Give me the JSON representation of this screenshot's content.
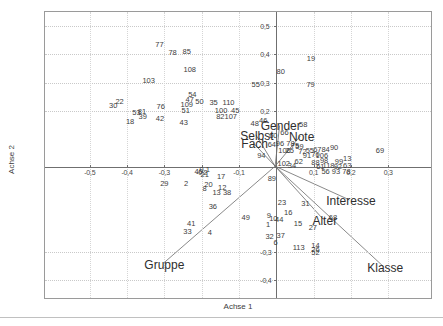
{
  "chart_data": {
    "type": "scatter",
    "title": "",
    "xlabel": "Achse 1",
    "ylabel": "Achse 2",
    "xlim": [
      -0.62,
      0.42
    ],
    "ylim": [
      -0.47,
      0.55
    ],
    "grid": true,
    "legend": "none",
    "xticks": [
      {
        "value": -0.5,
        "label": "-0,5"
      },
      {
        "value": -0.4,
        "label": "-0,4"
      },
      {
        "value": -0.3,
        "label": "-0,3"
      },
      {
        "value": -0.2,
        "label": "-0,2"
      },
      {
        "value": -0.1,
        "label": "-0,1"
      },
      {
        "value": 0.1,
        "label": "0,1"
      },
      {
        "value": 0.2,
        "label": "0,2"
      },
      {
        "value": 0.3,
        "label": "0,3"
      }
    ],
    "yticks": [
      {
        "value": 0.5,
        "label": "0,5"
      },
      {
        "value": 0.4,
        "label": "0,4"
      },
      {
        "value": 0.3,
        "label": "0,3"
      },
      {
        "value": 0.2,
        "label": "0,2"
      },
      {
        "value": -0.3,
        "label": "-0,3"
      },
      {
        "value": -0.4,
        "label": "-0,4"
      }
    ],
    "variables": [
      {
        "name": "Gender",
        "label": "Gender",
        "lx": 0.012,
        "ly": 0.145,
        "tipx": 0.004,
        "tipy": 0.03
      },
      {
        "name": "Selbst",
        "label": "Selbst",
        "lx": -0.052,
        "ly": 0.112,
        "tipx": -0.012,
        "tipy": 0.028
      },
      {
        "name": "Fach",
        "label": "Fach",
        "lx": -0.058,
        "ly": 0.082,
        "tipx": -0.016,
        "tipy": 0.022
      },
      {
        "name": "Note",
        "label": "Note",
        "lx": 0.068,
        "ly": 0.108,
        "tipx": 0.02,
        "tipy": 0.03
      },
      {
        "name": "Interesse",
        "label": "Interesse",
        "lx": 0.2,
        "ly": -0.12,
        "tipx": 0.165,
        "tipy": -0.088
      },
      {
        "name": "Alter",
        "label": "Alter",
        "lx": 0.13,
        "ly": -0.19,
        "tipx": 0.1,
        "tipy": -0.15
      },
      {
        "name": "Gruppe",
        "label": "Gruppe",
        "lx": -0.3,
        "ly": -0.345,
        "tipx": -0.262,
        "tipy": -0.31
      },
      {
        "name": "Klasse",
        "label": "Klasse",
        "lx": 0.292,
        "ly": -0.358,
        "tipx": 0.262,
        "tipy": -0.33
      }
    ],
    "points": [
      {
        "label": "77",
        "x": -0.313,
        "y": 0.432
      },
      {
        "label": "78",
        "x": -0.278,
        "y": 0.405
      },
      {
        "label": "85",
        "x": -0.24,
        "y": 0.41
      },
      {
        "label": "108",
        "x": -0.232,
        "y": 0.345
      },
      {
        "label": "103",
        "x": -0.342,
        "y": 0.305
      },
      {
        "label": "55",
        "x": -0.055,
        "y": 0.292
      },
      {
        "label": "80",
        "x": 0.012,
        "y": 0.337
      },
      {
        "label": "19",
        "x": 0.093,
        "y": 0.382
      },
      {
        "label": "79",
        "x": 0.092,
        "y": 0.292
      },
      {
        "label": "54",
        "x": -0.225,
        "y": 0.255
      },
      {
        "label": "47",
        "x": -0.232,
        "y": 0.238
      },
      {
        "label": "50",
        "x": -0.206,
        "y": 0.232
      },
      {
        "label": "109",
        "x": -0.24,
        "y": 0.222
      },
      {
        "label": "35",
        "x": -0.168,
        "y": 0.228
      },
      {
        "label": "110",
        "x": -0.128,
        "y": 0.228
      },
      {
        "label": "22",
        "x": -0.42,
        "y": 0.232
      },
      {
        "label": "30",
        "x": -0.437,
        "y": 0.218
      },
      {
        "label": "76",
        "x": -0.31,
        "y": 0.215
      },
      {
        "label": "51",
        "x": -0.243,
        "y": 0.198
      },
      {
        "label": "100",
        "x": -0.148,
        "y": 0.2
      },
      {
        "label": "45",
        "x": -0.11,
        "y": 0.2
      },
      {
        "label": "53",
        "x": -0.375,
        "y": 0.192
      },
      {
        "label": "81",
        "x": -0.36,
        "y": 0.196
      },
      {
        "label": "82",
        "x": -0.15,
        "y": 0.178
      },
      {
        "label": "107",
        "x": -0.122,
        "y": 0.178
      },
      {
        "label": "39",
        "x": -0.358,
        "y": 0.178
      },
      {
        "label": "42",
        "x": -0.312,
        "y": 0.172
      },
      {
        "label": "18",
        "x": -0.392,
        "y": 0.16
      },
      {
        "label": "43",
        "x": -0.248,
        "y": 0.158
      },
      {
        "label": "48",
        "x": -0.058,
        "y": 0.152
      },
      {
        "label": "46",
        "x": -0.035,
        "y": 0.165
      },
      {
        "label": "58",
        "x": 0.072,
        "y": 0.15
      },
      {
        "label": "60",
        "x": -0.008,
        "y": 0.112
      },
      {
        "label": "66",
        "x": 0.022,
        "y": 0.122
      },
      {
        "label": "64",
        "x": -0.012,
        "y": 0.08
      },
      {
        "label": "96",
        "x": 0.01,
        "y": 0.082
      },
      {
        "label": "78b",
        "x": 0.038,
        "y": 0.082
      },
      {
        "label": "75",
        "x": 0.05,
        "y": 0.075
      },
      {
        "label": "59",
        "x": 0.062,
        "y": 0.072
      },
      {
        "label": "90",
        "x": 0.155,
        "y": 0.068
      },
      {
        "label": "69",
        "x": 0.278,
        "y": 0.058
      },
      {
        "label": "106b",
        "x": 0.022,
        "y": 0.058
      },
      {
        "label": "25",
        "x": 0.036,
        "y": 0.056
      },
      {
        "label": "72",
        "x": 0.07,
        "y": 0.055
      },
      {
        "label": "55b",
        "x": 0.09,
        "y": 0.058
      },
      {
        "label": "67",
        "x": 0.11,
        "y": 0.06
      },
      {
        "label": "84",
        "x": 0.132,
        "y": 0.06
      },
      {
        "label": "94",
        "x": -0.04,
        "y": 0.04
      },
      {
        "label": "91",
        "x": 0.082,
        "y": 0.04
      },
      {
        "label": "70",
        "x": 0.105,
        "y": 0.042
      },
      {
        "label": "106",
        "x": 0.122,
        "y": 0.04
      },
      {
        "label": "62",
        "x": 0.06,
        "y": 0.018
      },
      {
        "label": "88",
        "x": 0.105,
        "y": 0.015
      },
      {
        "label": "98",
        "x": 0.128,
        "y": 0.022
      },
      {
        "label": "99",
        "x": 0.168,
        "y": 0.02
      },
      {
        "label": "13b",
        "x": 0.19,
        "y": 0.03
      },
      {
        "label": "102",
        "x": 0.02,
        "y": 0.012
      },
      {
        "label": "34",
        "x": 0.042,
        "y": 0.005
      },
      {
        "label": "61",
        "x": 0.118,
        "y": 0.002
      },
      {
        "label": "118",
        "x": 0.14,
        "y": 0.005
      },
      {
        "label": "92",
        "x": 0.165,
        "y": 0.0
      },
      {
        "label": "63",
        "x": 0.19,
        "y": 0.005
      },
      {
        "label": "56",
        "x": 0.132,
        "y": -0.018
      },
      {
        "label": "93",
        "x": 0.16,
        "y": -0.018
      },
      {
        "label": "78c",
        "x": 0.188,
        "y": -0.018
      },
      {
        "label": "40",
        "x": -0.208,
        "y": -0.015
      },
      {
        "label": "0.1",
        "x": -0.192,
        "y": -0.01
      },
      {
        "label": "21",
        "x": -0.192,
        "y": -0.028
      },
      {
        "label": "17",
        "x": -0.148,
        "y": -0.035
      },
      {
        "label": "89",
        "x": -0.012,
        "y": -0.042
      },
      {
        "label": "29",
        "x": -0.3,
        "y": -0.058
      },
      {
        "label": "2",
        "x": -0.242,
        "y": -0.058
      },
      {
        "label": "20",
        "x": -0.182,
        "y": -0.062
      },
      {
        "label": "8",
        "x": -0.192,
        "y": -0.078
      },
      {
        "label": "12",
        "x": -0.145,
        "y": -0.075
      },
      {
        "label": "13",
        "x": -0.16,
        "y": -0.092
      },
      {
        "label": "38",
        "x": -0.132,
        "y": -0.092
      },
      {
        "label": "23",
        "x": 0.015,
        "y": -0.128
      },
      {
        "label": "31",
        "x": 0.078,
        "y": -0.13
      },
      {
        "label": "36",
        "x": -0.17,
        "y": -0.14
      },
      {
        "label": "16",
        "x": 0.032,
        "y": -0.162
      },
      {
        "label": "49",
        "x": -0.082,
        "y": -0.178
      },
      {
        "label": "9",
        "x": -0.02,
        "y": -0.172
      },
      {
        "label": "10",
        "x": -0.008,
        "y": -0.182
      },
      {
        "label": "44",
        "x": 0.008,
        "y": -0.188
      },
      {
        "label": "68",
        "x": 0.152,
        "y": -0.18
      },
      {
        "label": "15",
        "x": 0.058,
        "y": -0.202
      },
      {
        "label": "27",
        "x": 0.098,
        "y": -0.215
      },
      {
        "label": "41",
        "x": -0.228,
        "y": -0.2
      },
      {
        "label": "1",
        "x": -0.022,
        "y": -0.205
      },
      {
        "label": "33",
        "x": -0.238,
        "y": -0.23
      },
      {
        "label": "4",
        "x": -0.178,
        "y": -0.232
      },
      {
        "label": "32",
        "x": -0.018,
        "y": -0.248
      },
      {
        "label": "37",
        "x": 0.012,
        "y": -0.245
      },
      {
        "label": "6",
        "x": -0.002,
        "y": -0.268
      },
      {
        "label": "113",
        "x": 0.06,
        "y": -0.285
      },
      {
        "label": "14",
        "x": 0.105,
        "y": -0.278
      },
      {
        "label": "26",
        "x": 0.105,
        "y": -0.292
      },
      {
        "label": "52",
        "x": 0.105,
        "y": -0.305
      }
    ]
  }
}
